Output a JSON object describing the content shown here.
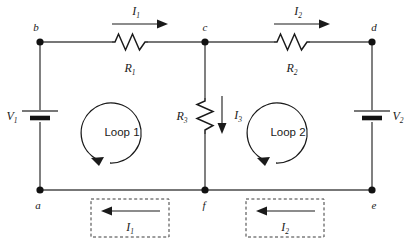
{
  "figure": {
    "background_color": "#ffffff",
    "wire_color": "#4a4a4a",
    "ink_color": "#1a1a1a"
  },
  "nodes": [
    {
      "id": "b",
      "label": "b",
      "x": 40,
      "y": 42
    },
    {
      "id": "c",
      "label": "c",
      "x": 205,
      "y": 42
    },
    {
      "id": "d",
      "label": "d",
      "x": 372,
      "y": 42
    },
    {
      "id": "a",
      "label": "a",
      "x": 40,
      "y": 190
    },
    {
      "id": "f",
      "label": "f",
      "x": 205,
      "y": 190
    },
    {
      "id": "e",
      "label": "e",
      "x": 372,
      "y": 190
    }
  ],
  "resistors": [
    {
      "id": "R1",
      "label": "R",
      "subscript": "1",
      "orientation": "horizontal",
      "x": 130,
      "y": 42
    },
    {
      "id": "R2",
      "label": "R",
      "subscript": "2",
      "orientation": "horizontal",
      "x": 292,
      "y": 42
    },
    {
      "id": "R3",
      "label": "R",
      "subscript": "3",
      "orientation": "vertical",
      "x": 205,
      "y": 116
    }
  ],
  "sources": [
    {
      "id": "V1",
      "label": "V",
      "subscript": "1",
      "x": 40,
      "y": 116,
      "label_side": "left"
    },
    {
      "id": "V2",
      "label": "V",
      "subscript": "2",
      "x": 372,
      "y": 116,
      "label_side": "right"
    }
  ],
  "currents": [
    {
      "id": "I1-top",
      "label": "I",
      "subscript": "1",
      "direction": "right",
      "x": 140,
      "y": 22
    },
    {
      "id": "I2-top",
      "label": "I",
      "subscript": "2",
      "direction": "right",
      "x": 302,
      "y": 22
    },
    {
      "id": "I3-middle",
      "label": "I",
      "subscript": "3",
      "direction": "down",
      "x": 224,
      "y": 116
    },
    {
      "id": "I1-bottom",
      "label": "I",
      "subscript": "1",
      "direction": "left",
      "x": 130,
      "y": 220
    },
    {
      "id": "I2-bottom",
      "label": "I",
      "subscript": "2",
      "direction": "left",
      "x": 285,
      "y": 220
    }
  ],
  "loops": [
    {
      "id": "loop1",
      "label": "Loop 1",
      "cx": 122,
      "cy": 132,
      "rotation": "counter-clockwise"
    },
    {
      "id": "loop2",
      "label": "Loop 2",
      "cx": 288,
      "cy": 132,
      "rotation": "counter-clockwise"
    }
  ],
  "annotation_boxes": [
    {
      "id": "box-I1",
      "x": 91,
      "y": 199,
      "width": 78,
      "height": 38,
      "style": "dashed"
    },
    {
      "id": "box-I2",
      "x": 246,
      "y": 199,
      "width": 78,
      "height": 38,
      "style": "dashed"
    }
  ]
}
